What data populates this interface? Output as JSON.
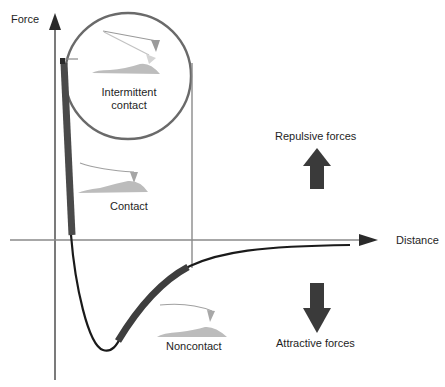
{
  "diagram": {
    "axes": {
      "y_label": "Force",
      "x_label": "Distance"
    },
    "regions": [
      {
        "id": "contact",
        "label": "Contact"
      },
      {
        "id": "intermittent",
        "label_line1": "Intermittent",
        "label_line2": "contact"
      },
      {
        "id": "noncontact",
        "label": "Noncontact"
      }
    ],
    "force_indicators": {
      "repulsive": "Repulsive forces",
      "attractive": "Attractive forces"
    },
    "colors": {
      "axis": "#6e6e6e",
      "curve": "#1a1a1a",
      "highlight": "#4a4a4a",
      "circle": "#6a6a6a",
      "arrow": "#3a3a3a",
      "sample": "#b8b8b8",
      "tip": "#a8a8a8"
    }
  }
}
